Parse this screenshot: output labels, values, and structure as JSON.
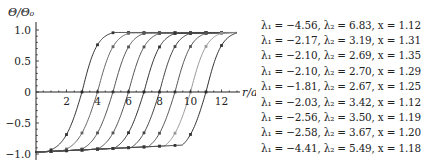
{
  "chart_data": {
    "type": "line",
    "title": "",
    "xlabel": "r/a",
    "ylabel": "Θ/Θ₀",
    "xlim": [
      0,
      13
    ],
    "ylim": [
      -1.0,
      1.0
    ],
    "x_ticks": [
      2,
      4,
      6,
      8,
      10,
      12
    ],
    "x_tick_labels": [
      "2",
      "4",
      "6",
      "8",
      "10",
      "12"
    ],
    "y_ticks": [
      -1.0,
      -0.5,
      0,
      0.5,
      1.0
    ],
    "y_tick_labels": [
      "−1.0",
      "−0.5",
      "0",
      "0.5",
      "1.0"
    ],
    "grid": false,
    "legend_position": "right",
    "marker_x": [
      1,
      2,
      3,
      4,
      5,
      6,
      7,
      8,
      9,
      10,
      11,
      12
    ],
    "series": [
      {
        "name": "λ1=−4.56, λ2=6.83, x=1.12",
        "crossing": 3,
        "lambda1": -4.56,
        "lambda2": 6.83,
        "x": 1.12,
        "color": "#333333"
      },
      {
        "name": "λ1=−2.17, λ2=3.19, x=1.31",
        "crossing": 4,
        "lambda1": -2.17,
        "lambda2": 3.19,
        "x": 1.31,
        "color": "#666666"
      },
      {
        "name": "λ1=−2.10, λ2=2.69, x=1.35",
        "crossing": 5,
        "lambda1": -2.1,
        "lambda2": 2.69,
        "x": 1.35,
        "color": "#555555"
      },
      {
        "name": "λ1=−2.10, λ2=2.70, x=1.29",
        "crossing": 6,
        "lambda1": -2.1,
        "lambda2": 2.7,
        "x": 1.29,
        "color": "#555555"
      },
      {
        "name": "λ1=−1.81, λ2=2.67, x=1.25",
        "crossing": 7,
        "lambda1": -1.81,
        "lambda2": 2.67,
        "x": 1.25,
        "color": "#333333"
      },
      {
        "name": "λ1=−2.03, λ2=3.42, x=1.12",
        "crossing": 8,
        "lambda1": -2.03,
        "lambda2": 3.42,
        "x": 1.12,
        "color": "#444444"
      },
      {
        "name": "λ1=−2.56, λ2=3.50, x=1.19",
        "crossing": 9,
        "lambda1": -2.56,
        "lambda2": 3.5,
        "x": 1.19,
        "color": "#555555"
      },
      {
        "name": "λ1=−2.58, λ2=3.67, x=1.20",
        "crossing": 10,
        "lambda1": -2.58,
        "lambda2": 3.67,
        "x": 1.2,
        "color": "#999999"
      },
      {
        "name": "λ1=−4.41, λ2=5.49, x=1.18",
        "crossing": 11,
        "lambda1": -4.41,
        "lambda2": 5.49,
        "x": 1.18,
        "color": "#333333"
      }
    ]
  },
  "legend": {
    "items": [
      {
        "label": "λ₁ = −4.56,  λ₂ = 6.83,  x = 1.12",
        "color": "#333333"
      },
      {
        "label": "λ₁ = −2.17,  λ₂ = 3.19,  x = 1.31",
        "color": "#666666"
      },
      {
        "label": "λ₁ = −2.10,  λ₂ = 2.69,  x = 1.35",
        "color": "#555555"
      },
      {
        "label": "λ₁ = −2.10,  λ₂ = 2.70,  x = 1.29",
        "color": "#555555"
      },
      {
        "label": "λ₁ = −1.81,  λ₂ = 2.67,  x = 1.25",
        "color": "#333333"
      },
      {
        "label": "λ₁ = −2.03,  λ₂ = 3.42,  x = 1.12",
        "color": "#444444"
      },
      {
        "label": "λ₁ = −2.56,  λ₂ = 3.50,  x = 1.19",
        "color": "#555555"
      },
      {
        "label": "λ₁ = −2.58,  λ₂ = 3.67,  x = 1.20",
        "color": "#999999"
      },
      {
        "label": "λ₁ = −4.41,  λ₂ = 5.49,  x = 1.18",
        "color": "#333333"
      }
    ]
  }
}
